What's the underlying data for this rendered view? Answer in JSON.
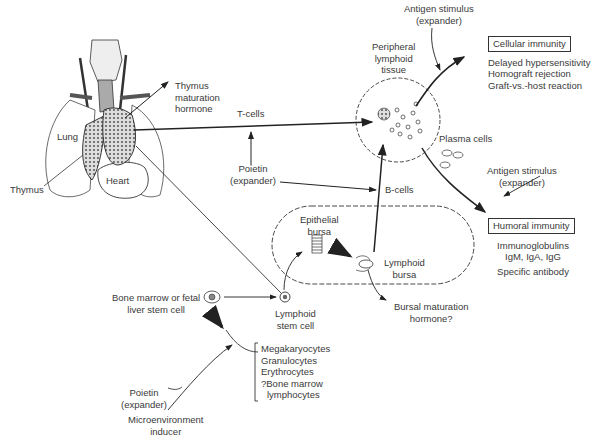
{
  "diagram": {
    "type": "immune system development flow diagram",
    "labels": {
      "thymus_maturation_hormone": [
        "Thymus",
        "maturation",
        "hormone"
      ],
      "lung": "Lung",
      "thymus": "Thymus",
      "heart": "Heart",
      "t_cells": "T-cells",
      "poietin_upper": [
        "Poietin",
        "(expander)"
      ],
      "b_cells": "B-cells",
      "peripheral_lymphoid_tissue": [
        "Peripheral",
        "lymphoid",
        "tissue"
      ],
      "antigen_stimulus_top": [
        "Antigen stimulus",
        "(expander)"
      ],
      "plasma_cells": "Plasma cells",
      "antigen_stimulus_right": [
        "Antigen stimulus",
        "(expander)"
      ],
      "epithelial_bursa": [
        "Epithelial",
        "bursa"
      ],
      "lymphoid_bursa": [
        "Lymphoid",
        "bursa"
      ],
      "bursal_maturation_hormone": [
        "Bursal maturation",
        "hormone?"
      ],
      "bone_marrow_stem_cell": [
        "Bone marrow or fetal",
        "liver stem cell"
      ],
      "lymphoid_stem_cell": [
        "Lymphoid",
        "stem cell"
      ],
      "poietin_lower": [
        "Poietin",
        "(expander)"
      ],
      "microenvironment_inducer": [
        "Microenvironment",
        "inducer"
      ]
    },
    "cellular_immunity": {
      "title": "Cellular immunity",
      "items": [
        "Delayed hypersensitivity",
        "Homograft rejection",
        "Graft-vs.-host reaction"
      ]
    },
    "humoral_immunity": {
      "title": "Humoral immunity",
      "items": [
        "Immunoglobulins",
        "IgM, IgA, IgG",
        "Specific antibody"
      ]
    },
    "other_lineages": [
      "Megakaryocytes",
      "Granulocytes",
      "Erythrocytes",
      "?Bone marrow",
      "lymphocytes"
    ]
  }
}
